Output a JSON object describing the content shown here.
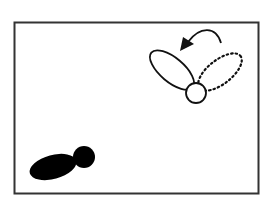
{
  "diagram": {
    "background": "#ffffff",
    "frame_color": "#333333",
    "ink_color": "#111111",
    "elements": [
      {
        "name": "frame",
        "type": "rectangle"
      },
      {
        "name": "rotated-shape-solid",
        "type": "ellipse-with-circle",
        "style": "outline"
      },
      {
        "name": "original-shape-dotted",
        "type": "ellipse",
        "style": "dotted"
      },
      {
        "name": "rotation-arrow",
        "type": "curved-arrow",
        "direction": "counterclockwise"
      },
      {
        "name": "filled-shape",
        "type": "ellipse-with-circle",
        "style": "filled"
      }
    ]
  }
}
